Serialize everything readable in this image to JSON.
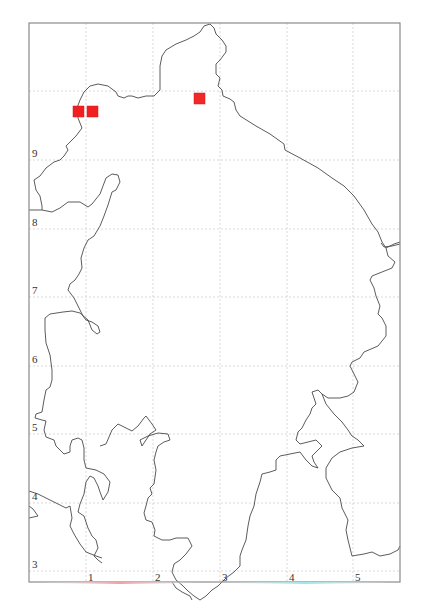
{
  "map": {
    "frame": {
      "left": 29,
      "top": 23,
      "right": 400,
      "bottom": 582
    },
    "x_axis": {
      "ticks": [
        {
          "label": "1",
          "px": 86
        },
        {
          "label": "2",
          "px": 153
        },
        {
          "label": "3",
          "px": 220
        },
        {
          "label": "4",
          "px": 287
        },
        {
          "label": "5",
          "px": 353
        }
      ]
    },
    "y_axis": {
      "ticks": [
        {
          "label": "9",
          "px": 160
        },
        {
          "label": "8",
          "px": 229
        },
        {
          "label": "7",
          "px": 297
        },
        {
          "label": "6",
          "px": 366
        },
        {
          "label": "5",
          "px": 434
        },
        {
          "label": "4",
          "px": 503
        },
        {
          "label": "3",
          "px": 571
        }
      ]
    },
    "markers": [
      {
        "x": 0.82,
        "y": 9.72,
        "color": "#f02020",
        "size": 10
      },
      {
        "x": 1.03,
        "y": 9.72,
        "color": "#f02020",
        "size": 10
      },
      {
        "x": 2.66,
        "y": 9.91,
        "color": "#f02828",
        "size": 10
      }
    ],
    "colors": {
      "marker": "#f02020",
      "coastline": "#4a4a4a",
      "grid": "#cfcfcf",
      "frame": "#8a8a8a"
    }
  }
}
